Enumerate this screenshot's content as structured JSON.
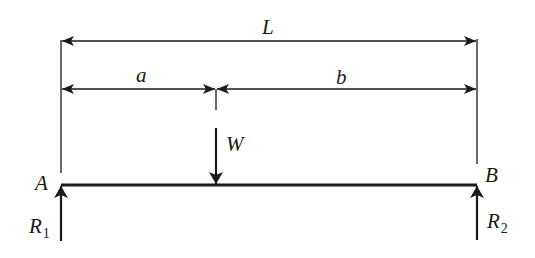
{
  "diagram": {
    "colors": {
      "line": "#1a1a1a",
      "background": "#ffffff"
    },
    "labels": {
      "total_length": "L",
      "left_segment": "a",
      "right_segment": "b",
      "load": "W",
      "left_support": "A",
      "right_support": "B",
      "left_reaction": "R",
      "left_reaction_sub": "1",
      "right_reaction": "R",
      "right_reaction_sub": "2"
    },
    "geometry": {
      "beam": {
        "x1": 61,
        "x2": 477,
        "y": 185
      },
      "load_x": 216,
      "dimension_L_y": 41,
      "dimension_ab_y": 89
    }
  }
}
